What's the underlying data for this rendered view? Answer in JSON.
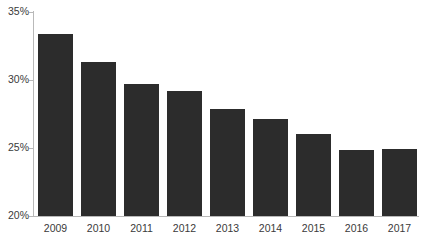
{
  "chart_data": {
    "type": "bar",
    "title": "",
    "subtitle": "",
    "xlabel": "",
    "ylabel": "",
    "categories": [
      "2009",
      "2010",
      "2011",
      "2012",
      "2013",
      "2014",
      "2015",
      "2016",
      "2017"
    ],
    "values": [
      33.4,
      31.3,
      29.7,
      29.2,
      27.9,
      27.1,
      26.0,
      24.85,
      24.95
    ],
    "value_labels": [
      "33.4%",
      "31.3%",
      "29.7%",
      "29.2%",
      "27.9%",
      "27.1%",
      "26.0%",
      "24.9%",
      "25.0%"
    ],
    "ylim": [
      20,
      35
    ],
    "y_ticks": [
      20,
      25,
      30,
      35
    ],
    "y_tick_labels": [
      "20%",
      "25%",
      "30%",
      "35%"
    ],
    "grid": false,
    "legend": null,
    "legend_position": "none",
    "bar_color": "#2c2c2c",
    "axis_color": "#b9b9b9",
    "label_color": "#3a3a3a",
    "background_color": "#ffffff",
    "annotations": []
  },
  "axis": {
    "y_ticks": [
      {
        "label": "35%",
        "value": 35
      },
      {
        "label": "30%",
        "value": 30
      },
      {
        "label": "25%",
        "value": 25
      },
      {
        "label": "20%",
        "value": 20
      }
    ],
    "x_ticks": [
      {
        "label": "2009"
      },
      {
        "label": "2010"
      },
      {
        "label": "2011"
      },
      {
        "label": "2012"
      },
      {
        "label": "2013"
      },
      {
        "label": "2014"
      },
      {
        "label": "2015"
      },
      {
        "label": "2016"
      },
      {
        "label": "2017"
      }
    ]
  }
}
